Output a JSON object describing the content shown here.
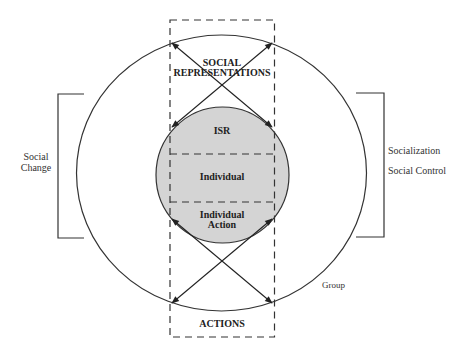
{
  "diagram": {
    "colors": {
      "line": "#222222",
      "inner_fill": "#d4d4d4",
      "background": "#ffffff"
    },
    "outer_circle": {
      "label": "Group"
    },
    "inner_circle": {
      "label": "Individual"
    },
    "top_box": {
      "line1": "SOCIAL",
      "line2": "REPRESENTATIONS",
      "inner_label": "ISR"
    },
    "bottom_box": {
      "inner_line1": "Individual",
      "inner_line2": "Action",
      "label": "ACTIONS"
    },
    "left_bracket": {
      "line1": "Social",
      "line2": "Change"
    },
    "right_bracket": {
      "line1": "Socialization",
      "line2": "Social Control"
    }
  }
}
